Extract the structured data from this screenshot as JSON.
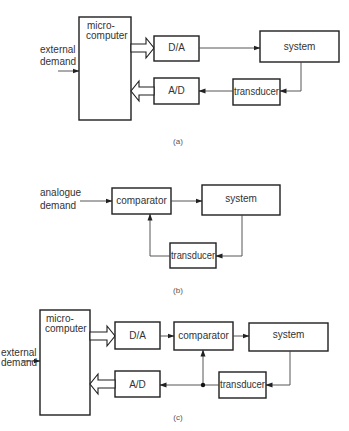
{
  "colors": {
    "stroke": "#1e1e1e",
    "line": "#444444",
    "text": "#333333",
    "background": "#ffffff"
  },
  "diagrams": [
    {
      "caption": "(a)",
      "title": "Microcomputer control with D/A and A/D conversion",
      "blocks": {
        "microcomputer": {
          "line1": "micro-",
          "line2": "computer"
        },
        "da": "D/A",
        "ad": "A/D",
        "system": "system",
        "transducer": "transducer"
      },
      "input": {
        "line1": "external",
        "line2": "demand"
      },
      "connections": [
        "external demand -> microcomputer",
        "microcomputer => D/A (bus)",
        "D/A -> system",
        "system -> transducer",
        "transducer -> A/D",
        "A/D => microcomputer (bus)"
      ]
    },
    {
      "caption": "(b)",
      "title": "Analogue closed-loop control",
      "blocks": {
        "comparator": "comparator",
        "system": "system",
        "transducer": "transducer"
      },
      "input": {
        "line1": "analogue",
        "line2": "demand"
      },
      "connections": [
        "analogue demand -> comparator",
        "comparator -> system",
        "system -> transducer",
        "transducer -> comparator"
      ]
    },
    {
      "caption": "(c)",
      "title": "Hybrid: microcomputer demand with analogue comparator loop",
      "blocks": {
        "microcomputer": {
          "line1": "micro-",
          "line2": "computer"
        },
        "da": "D/A",
        "comparator": "comparator",
        "system": "system",
        "ad": "A/D",
        "transducer": "transducer"
      },
      "input": {
        "line1": "external",
        "line2": "demand"
      },
      "connections": [
        "external demand -> microcomputer",
        "microcomputer => D/A (bus)",
        "D/A -> comparator",
        "comparator -> system",
        "system -> transducer",
        "transducer -> junction",
        "junction -> comparator",
        "junction -> A/D",
        "A/D => microcomputer (bus)"
      ]
    }
  ]
}
